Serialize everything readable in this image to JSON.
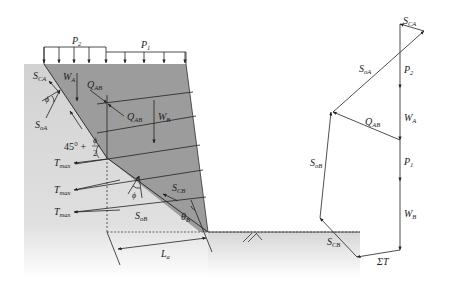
{
  "wall_section": {
    "loads": {
      "p2": "P",
      "p2_sub": "2",
      "p1": "P",
      "p1_sub": "1"
    },
    "wedge_a": {
      "s_ca": "S",
      "s_ca_sub": "CA",
      "w_a": "W",
      "w_a_sub": "A",
      "phi": "ϕ",
      "s_oa": "S",
      "s_oa_sub": "oA"
    },
    "interface": {
      "q_ab_top": "Q",
      "q_ab_top_sub": "AB",
      "q_ab_bottom": "Q",
      "q_ab_bottom_sub": "AB"
    },
    "wedge_b": {
      "w_b": "W",
      "w_b_sub": "B"
    },
    "angle_label": {
      "prefix": "45° + ",
      "num": "ϕ",
      "den": "2"
    },
    "tmax": [
      {
        "text": "T",
        "sub": "max"
      },
      {
        "text": "T",
        "sub": "max"
      },
      {
        "text": "T",
        "sub": "max"
      }
    ],
    "base": {
      "phi": "ϕ",
      "s_cb": "S",
      "s_cb_sub": "CB",
      "s_ob": "S",
      "s_ob_sub": "oB",
      "theta_b": "θ",
      "theta_b_sub": "B",
      "l_a": "L",
      "l_a_sub": "a"
    }
  },
  "force_polygon": {
    "s_ca": {
      "text": "S",
      "sub": "CA"
    },
    "s_oa": {
      "text": "S",
      "sub": "oA"
    },
    "p2": {
      "text": "P",
      "sub": "2"
    },
    "w_a": {
      "text": "W",
      "sub": "A"
    },
    "q_ab": {
      "text": "Q",
      "sub": "AB"
    },
    "p1": {
      "text": "P",
      "sub": "1"
    },
    "s_ob": {
      "text": "S",
      "sub": "oB"
    },
    "w_b": {
      "text": "W",
      "sub": "B"
    },
    "s_cb": {
      "text": "S",
      "sub": "CB"
    },
    "sum_t": {
      "text": "ΣT"
    }
  },
  "colors": {
    "soil_light": "#d4d4d4",
    "soil_fade": "#ffffff",
    "reinforced_zone": "#9a9a9a",
    "line": "#222222"
  }
}
